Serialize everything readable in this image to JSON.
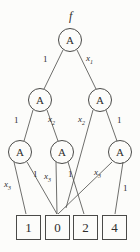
{
  "diagram": {
    "function_label": "f",
    "node_symbol": "A",
    "nodes": [
      {
        "id": "root",
        "label": "A",
        "cx": 70,
        "cy": 40,
        "r": 12
      },
      {
        "id": "L2a",
        "label": "A",
        "cx": 40,
        "cy": 100,
        "r": 12
      },
      {
        "id": "L2b",
        "label": "A",
        "cx": 100,
        "cy": 100,
        "r": 12
      },
      {
        "id": "L3a",
        "label": "A",
        "cx": 20,
        "cy": 152,
        "r": 12
      },
      {
        "id": "L3b",
        "label": "A",
        "cx": 62,
        "cy": 152,
        "r": 12
      },
      {
        "id": "L3c",
        "label": "A",
        "cx": 120,
        "cy": 152,
        "r": 12
      }
    ],
    "leaves": [
      {
        "id": "leaf1",
        "value": "1",
        "x": 16,
        "y": 215,
        "w": 25,
        "h": 25
      },
      {
        "id": "leaf0",
        "value": "0",
        "x": 45,
        "y": 215,
        "w": 25,
        "h": 25
      },
      {
        "id": "leaf2",
        "value": "2",
        "x": 73,
        "y": 215,
        "w": 25,
        "h": 25
      },
      {
        "id": "leaf4",
        "value": "4",
        "x": 102,
        "y": 215,
        "w": 25,
        "h": 25
      }
    ],
    "edges": [
      {
        "id": "e-root-L2a",
        "from": "root",
        "to": "L2a",
        "x1": 63,
        "y1": 50,
        "x2": 44,
        "y2": 89
      },
      {
        "id": "e-root-L2b",
        "from": "root",
        "to": "L2b",
        "x1": 77,
        "y1": 50,
        "x2": 96,
        "y2": 89
      },
      {
        "id": "e-L2a-L3a",
        "from": "L2a",
        "to": "L3a",
        "x1": 33,
        "y1": 110,
        "x2": 24,
        "y2": 141
      },
      {
        "id": "e-L2a-L3b",
        "from": "L2a",
        "to": "L3b",
        "x1": 47,
        "y1": 110,
        "x2": 58,
        "y2": 141
      },
      {
        "id": "e-L2b-L3b",
        "from": "L2b",
        "to": "L3b",
        "x1": 93,
        "y1": 110,
        "x2": 66,
        "y2": 208
      },
      {
        "id": "e-L2b-L3c",
        "from": "L2b",
        "to": "L3c",
        "x1": 106,
        "y1": 110,
        "x2": 117,
        "y2": 141
      },
      {
        "id": "e-L3a-leaf1",
        "from": "L3a",
        "to": "leaf1",
        "x1": 14,
        "y1": 162,
        "x2": 26,
        "y2": 214
      },
      {
        "id": "e-L3a-leaf0",
        "from": "L3a",
        "to": "leaf0",
        "x1": 27,
        "y1": 162,
        "x2": 57,
        "y2": 214
      },
      {
        "id": "e-L3b-leaf0",
        "from": "L3b",
        "to": "leaf0",
        "x1": 56,
        "y1": 162,
        "x2": 57,
        "y2": 214
      },
      {
        "id": "e-L3b-leaf2",
        "from": "L3b",
        "to": "leaf2",
        "x1": 68,
        "y1": 162,
        "x2": 84,
        "y2": 214
      },
      {
        "id": "e-L3c-leaf0",
        "from": "L3c",
        "to": "leaf0",
        "x1": 112,
        "y1": 162,
        "x2": 58,
        "y2": 214
      },
      {
        "id": "e-L3c-leaf4",
        "from": "L3c",
        "to": "leaf4",
        "x1": 123,
        "y1": 162,
        "x2": 115,
        "y2": 214
      }
    ],
    "edge_labels": [
      {
        "id": "lbl-root-left",
        "text": "1",
        "variable": false,
        "sub": "",
        "x": 43,
        "y": 55
      },
      {
        "id": "lbl-root-right",
        "text": "x",
        "variable": true,
        "sub": "1",
        "x": 86,
        "y": 54
      },
      {
        "id": "lbl-L2a-left",
        "text": "1",
        "variable": false,
        "sub": "",
        "x": 14,
        "y": 116
      },
      {
        "id": "lbl-L2a-right",
        "text": "x",
        "variable": true,
        "sub": "2",
        "x": 48,
        "y": 115
      },
      {
        "id": "lbl-L2b-left",
        "text": "x",
        "variable": true,
        "sub": "2",
        "x": 78,
        "y": 115
      },
      {
        "id": "lbl-L2b-right",
        "text": "1",
        "variable": false,
        "sub": "",
        "x": 117,
        "y": 116
      },
      {
        "id": "lbl-L3a-left",
        "text": "x",
        "variable": true,
        "sub": "3",
        "x": 4,
        "y": 180
      },
      {
        "id": "lbl-L3a-right",
        "text": "1",
        "variable": false,
        "sub": "",
        "x": 33,
        "y": 170
      },
      {
        "id": "lbl-L3b-left",
        "text": "x",
        "variable": true,
        "sub": "3",
        "x": 44,
        "y": 172
      },
      {
        "id": "lbl-L3b-right",
        "text": "1",
        "variable": false,
        "sub": "",
        "x": 68,
        "y": 170
      },
      {
        "id": "lbl-L3c-left",
        "text": "x",
        "variable": true,
        "sub": "3",
        "x": 94,
        "y": 168
      },
      {
        "id": "lbl-L3c-right",
        "text": "1",
        "variable": false,
        "sub": "",
        "x": 123,
        "y": 184
      }
    ],
    "function_label_pos": {
      "x": 69,
      "y": 10
    },
    "colors": {
      "stroke": "#4a4a48",
      "text": "#2e2e2c",
      "background": "#fcfcfa"
    }
  }
}
